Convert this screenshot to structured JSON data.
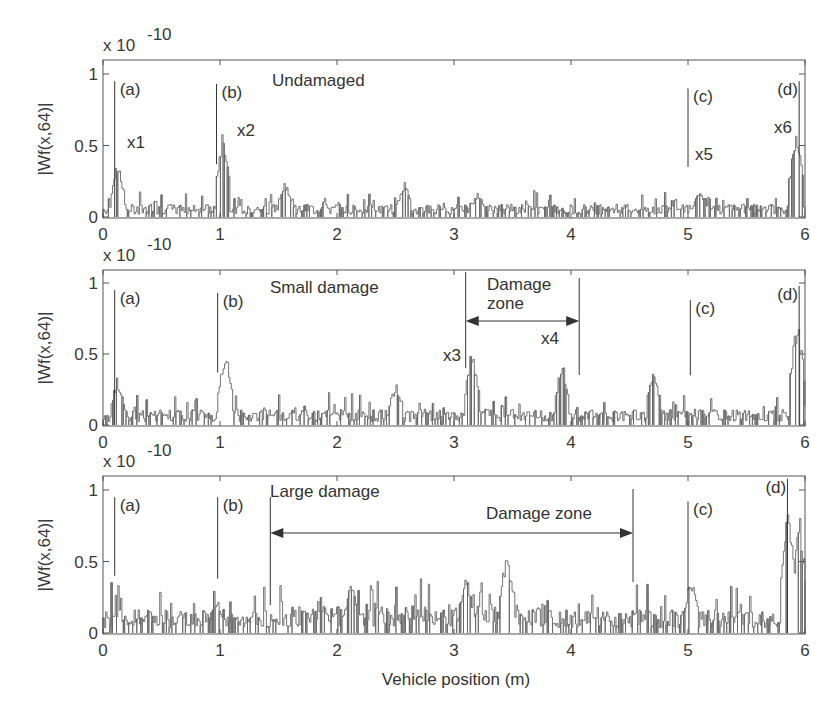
{
  "chart_data": [
    {
      "type": "line",
      "title": "Undamaged",
      "xlabel": "",
      "ylabel": "|Wf(x,64)|",
      "y_scale_label": "x 10",
      "y_scale_exponent": "-10",
      "xlim": [
        0,
        6
      ],
      "ylim": [
        0,
        1.08
      ],
      "xticks": [
        "0",
        "1",
        "2",
        "3",
        "4",
        "5",
        "6"
      ],
      "yticks": [
        "0",
        "0.5",
        "1"
      ],
      "markers": [
        {
          "label": "(a)",
          "x": 0.1,
          "y_top": 0.95,
          "y_bottom": 0.0
        },
        {
          "label": "(b)",
          "x": 0.97,
          "y_top": 0.93,
          "y_bottom": 0.37
        },
        {
          "label": "(c)",
          "x": 5.0,
          "y_top": 0.9,
          "y_bottom": 0.35
        },
        {
          "label": "(d)",
          "x": 5.95,
          "y_top": 0.95,
          "y_bottom": 0.0
        }
      ],
      "annotations": [
        "x1",
        "x2",
        "x5",
        "x6"
      ],
      "peaks": [
        {
          "x": 0.12,
          "y": 0.4
        },
        {
          "x": 1.02,
          "y": 0.64
        },
        {
          "x": 1.55,
          "y": 0.26
        },
        {
          "x": 2.57,
          "y": 0.25
        },
        {
          "x": 3.2,
          "y": 0.18
        },
        {
          "x": 5.1,
          "y": 0.2
        },
        {
          "x": 5.92,
          "y": 0.65
        }
      ]
    },
    {
      "type": "line",
      "title": "Small damage",
      "xlabel": "",
      "ylabel": "|Wf(x,64)|",
      "y_scale_label": "x 10",
      "y_scale_exponent": "-10",
      "xlim": [
        0,
        6
      ],
      "ylim": [
        0,
        1.08
      ],
      "xticks": [
        "0",
        "1",
        "2",
        "3",
        "4",
        "5",
        "6"
      ],
      "yticks": [
        "0",
        "0.5",
        "1"
      ],
      "markers": [
        {
          "label": "(a)",
          "x": 0.1,
          "y_top": 0.95,
          "y_bottom": 0.0
        },
        {
          "label": "(b)",
          "x": 0.98,
          "y_top": 0.93,
          "y_bottom": 0.37
        },
        {
          "label": "(c)",
          "x": 5.02,
          "y_top": 0.88,
          "y_bottom": 0.35
        },
        {
          "label": "(d)",
          "x": 5.95,
          "y_top": 0.98,
          "y_bottom": 0.0
        }
      ],
      "damage_zone": {
        "label": "Damage zone",
        "x_start": 3.1,
        "x_end": 4.07
      },
      "annotations": [
        "x3",
        "x4"
      ],
      "peaks": [
        {
          "x": 0.12,
          "y": 0.35
        },
        {
          "x": 1.04,
          "y": 0.58
        },
        {
          "x": 2.5,
          "y": 0.32
        },
        {
          "x": 3.15,
          "y": 0.56
        },
        {
          "x": 3.92,
          "y": 0.48
        },
        {
          "x": 4.7,
          "y": 0.44
        },
        {
          "x": 5.93,
          "y": 0.82
        }
      ]
    },
    {
      "type": "line",
      "title": "Large damage",
      "xlabel": "Vehicle position (m)",
      "ylabel": "|Wf(x,64)|",
      "y_scale_label": "x 10",
      "y_scale_exponent": "-10",
      "xlim": [
        0,
        6
      ],
      "ylim": [
        0,
        1.08
      ],
      "xticks": [
        "0",
        "1",
        "2",
        "3",
        "4",
        "5",
        "6"
      ],
      "yticks": [
        "0",
        "0.5",
        "1"
      ],
      "markers": [
        {
          "label": "(a)",
          "x": 0.1,
          "y_top": 0.95,
          "y_bottom": 0.4
        },
        {
          "label": "(b)",
          "x": 0.98,
          "y_top": 0.95,
          "y_bottom": 0.38
        },
        {
          "label": "(c)",
          "x": 5.0,
          "y_top": 0.92,
          "y_bottom": 0.3
        },
        {
          "label": "(d)",
          "x": 5.85,
          "y_top": 1.08,
          "y_bottom": 0.0
        }
      ],
      "damage_zone": {
        "label": "Damage zone",
        "x_start": 1.43,
        "x_end": 4.53
      },
      "peaks": [
        {
          "x": 0.97,
          "y": 0.25
        },
        {
          "x": 2.12,
          "y": 0.3
        },
        {
          "x": 3.1,
          "y": 0.33
        },
        {
          "x": 3.45,
          "y": 0.49
        },
        {
          "x": 5.02,
          "y": 0.4
        },
        {
          "x": 5.85,
          "y": 1.05
        },
        {
          "x": 5.95,
          "y": 0.85
        }
      ]
    }
  ]
}
